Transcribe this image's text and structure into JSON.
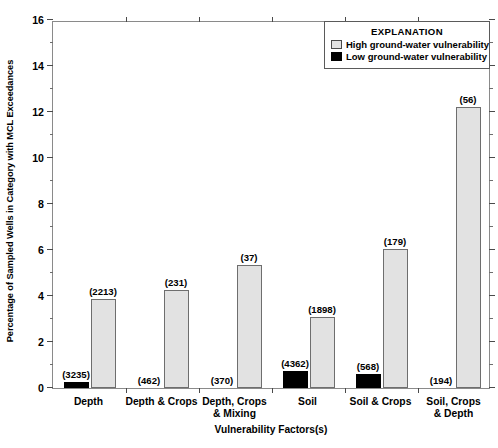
{
  "chart_data": {
    "type": "bar",
    "title": "",
    "xlabel": "Vulnerability Factors(s)",
    "ylabel": "Percentage of Sampled Wells in Category with MCL Exceedances",
    "ylim": [
      0,
      16
    ],
    "ytick_values": [
      0,
      2,
      4,
      6,
      8,
      10,
      12,
      14,
      16
    ],
    "ytick_labels": [
      "0",
      "2",
      "4",
      "6",
      "8",
      "10",
      "12",
      "14",
      "16"
    ],
    "yminor_values": [
      1,
      3,
      5,
      7,
      9,
      11,
      13,
      15
    ],
    "grid": false,
    "legend_position": "top-right",
    "legend_title": "EXPLANATION",
    "categories": [
      "Depth",
      "Depth & Crops",
      "Depth, Crops\n& Mixing",
      "Soil",
      "Soil & Crops",
      "Soil, Crops\n& Depth"
    ],
    "series": [
      {
        "name": "Low ground-water vulnerability",
        "color": "#000000",
        "values": [
          0.25,
          0.0,
          0.0,
          0.74,
          0.6,
          0.0
        ],
        "counts": [
          "(3235)",
          "(462)",
          "(370)",
          "(4362)",
          "(568)",
          "(194)"
        ]
      },
      {
        "name": "High ground-water vulnerability",
        "color": "#e2e2e2",
        "values": [
          3.85,
          4.26,
          5.35,
          3.1,
          6.05,
          12.2
        ],
        "counts": [
          "(2213)",
          "(231)",
          "(37)",
          "(1898)",
          "(179)",
          "(56)"
        ]
      }
    ]
  },
  "legend": {
    "title": "EXPLANATION",
    "entries": [
      {
        "label": "High ground-water vulnerability",
        "swatch": "high-vulnerability-swatch"
      },
      {
        "label": "Low ground-water vulnerability",
        "swatch": "low-vulnerability-swatch"
      }
    ]
  },
  "axes": {
    "y_title": "Percentage of Sampled Wells in Category with MCL Exceedances",
    "x_title": "Vulnerability Factors(s)",
    "y_ticks": [
      "16",
      "14",
      "12",
      "10",
      "8",
      "6",
      "4",
      "2",
      "0"
    ]
  },
  "categories": {
    "c0": "Depth",
    "c1": "Depth & Crops",
    "c2": "Depth, Crops\n& Mixing",
    "c3": "Soil",
    "c4": "Soil & Crops",
    "c5": "Soil, Crops\n& Depth"
  },
  "counts": {
    "low": {
      "c0": "(3235)",
      "c1": "(462)",
      "c2": "(370)",
      "c3": "(4362)",
      "c4": "(568)",
      "c5": "(194)"
    },
    "high": {
      "c0": "(2213)",
      "c1": "(231)",
      "c2": "(37)",
      "c3": "(1898)",
      "c4": "(179)",
      "c5": "(56)"
    }
  }
}
